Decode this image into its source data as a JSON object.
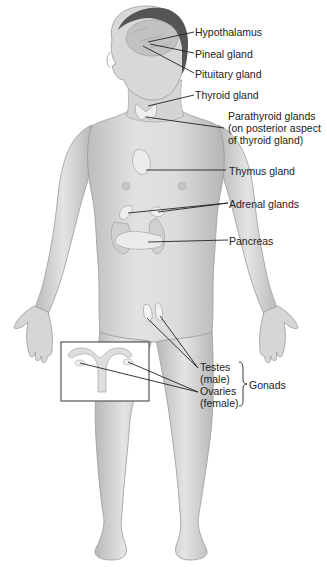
{
  "labels": {
    "hypothalamus": "Hypothalamus",
    "pineal": "Pineal gland",
    "pituitary": "Pituitary gland",
    "thyroid": "Thyroid gland",
    "parathyroid_1": "Parathyroid glands",
    "parathyroid_2": "(on posterior aspect",
    "parathyroid_3": "of thyroid gland)",
    "thymus": "Thymus gland",
    "adrenal": "Adrenal glands",
    "pancreas": "Pancreas",
    "testes_1": "Testes",
    "testes_2": "(male)",
    "ovaries_1": "Ovaries",
    "ovaries_2": "(female)",
    "gonads": "Gonads"
  },
  "colors": {
    "skin": "#d9d9d9",
    "skin_shadow": "#b8b8b8",
    "outline": "#8a8a8a",
    "hair": "#555555",
    "brain": "#c4c4c4",
    "gland": "#eeeeee",
    "leader": "#222222"
  }
}
